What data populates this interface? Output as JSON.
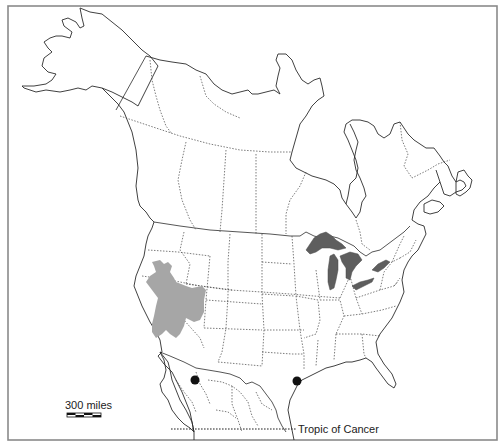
{
  "map": {
    "title": "",
    "region": "North America",
    "labels": {
      "scale_text": "300 miles",
      "tropic_text": "Tropic of Cancer"
    },
    "legend": {
      "scale_bar_segments": 4
    },
    "features": {
      "range_shaded": {
        "description": "Great Basin region (Nevada/Utah) shaded gray",
        "color": "#a6a6a6"
      },
      "great_lakes": {
        "color": "#5e5e5e"
      },
      "occurrence_points": [
        {
          "name": "point-chihuahua",
          "x": 195,
          "y": 380
        },
        {
          "name": "point-texas-coast",
          "x": 297,
          "y": 381
        }
      ]
    },
    "colors": {
      "outline": "#2b2b2b",
      "frame": "#8a8a8a",
      "background": "#ffffff",
      "dot": "#111111"
    }
  }
}
